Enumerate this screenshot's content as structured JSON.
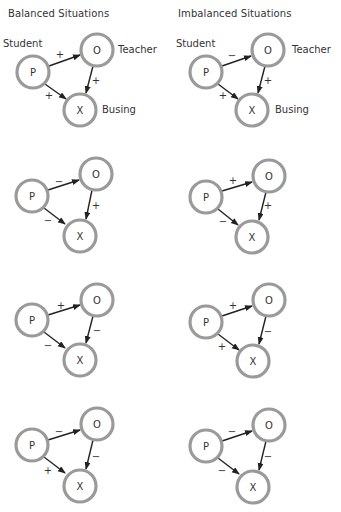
{
  "columns": [
    {
      "title": "Balanced Situations"
    },
    {
      "title": "Imbalanced Situations"
    }
  ],
  "node_labels": {
    "p": "P",
    "o": "O",
    "x": "X"
  },
  "role_labels": {
    "p": "Student",
    "o": "Teacher",
    "x": "Busing"
  },
  "diagrams": [
    {
      "column": "balanced",
      "row": 1,
      "p_o": "+",
      "o_x": "+",
      "p_x": "+"
    },
    {
      "column": "imbalanced",
      "row": 1,
      "p_o": "−",
      "o_x": "+",
      "p_x": "+"
    },
    {
      "column": "balanced",
      "row": 2,
      "p_o": "−",
      "o_x": "+",
      "p_x": "−"
    },
    {
      "column": "imbalanced",
      "row": 2,
      "p_o": "+",
      "o_x": "+",
      "p_x": "−"
    },
    {
      "column": "balanced",
      "row": 3,
      "p_o": "+",
      "o_x": "−",
      "p_x": "−"
    },
    {
      "column": "imbalanced",
      "row": 3,
      "p_o": "+",
      "o_x": "−",
      "p_x": "+"
    },
    {
      "column": "balanced",
      "row": 4,
      "p_o": "−",
      "o_x": "−",
      "p_x": "+"
    },
    {
      "column": "imbalanced",
      "row": 4,
      "p_o": "−",
      "o_x": "−",
      "p_x": "−"
    }
  ],
  "colors": {
    "node_stroke": "#9a9a9a",
    "arrow": "#222222",
    "text": "#333333"
  }
}
